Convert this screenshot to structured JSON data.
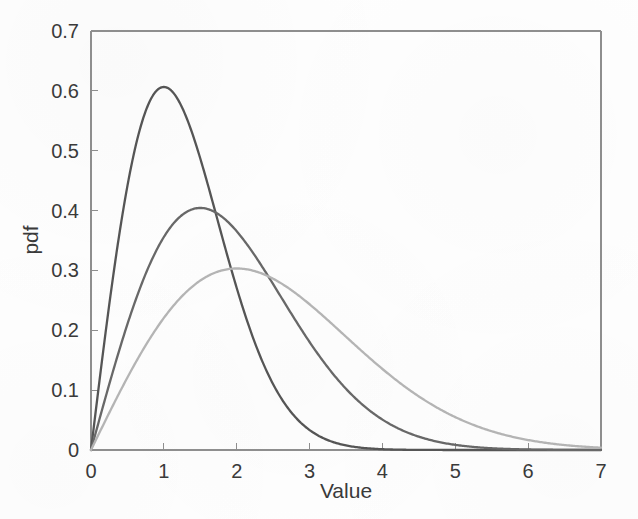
{
  "figure": {
    "background_color": "#fefefe",
    "axis_color": "#8e8e8e",
    "text_color": "#3a3a3a"
  },
  "chart_data": {
    "type": "line",
    "title": "",
    "subtitle": "",
    "xlabel": "Value",
    "ylabel": "pdf",
    "xlim": [
      0,
      7
    ],
    "ylim": [
      0,
      0.7
    ],
    "xticks": [
      0,
      1,
      2,
      3,
      4,
      5,
      6,
      7
    ],
    "xticklabels": [
      "0",
      "1",
      "2",
      "3",
      "4",
      "5",
      "6",
      "7"
    ],
    "yticks": [
      0,
      0.1,
      0.2,
      0.3,
      0.4,
      0.5,
      0.6,
      0.7
    ],
    "yticklabels": [
      "0",
      "0.1",
      "0.2",
      "0.3",
      "0.4",
      "0.5",
      "0.6",
      "0.7"
    ],
    "grid": false,
    "legend": null,
    "legend_position": "none",
    "distribution": "Rayleigh",
    "series": [
      {
        "name": "Rayleigh sigma = 1",
        "color": "#555555",
        "sigma": 1,
        "peak_x": 1,
        "peak_y": 0.6065,
        "x": [
          0,
          0.1,
          0.2,
          0.3,
          0.4,
          0.5,
          0.6,
          0.7,
          0.8,
          0.9,
          1,
          1.1,
          1.2,
          1.3,
          1.4,
          1.5,
          1.6,
          1.7,
          1.8,
          1.9,
          2,
          2.2,
          2.4,
          2.6,
          2.8,
          3,
          3.2,
          3.4,
          3.6,
          3.8,
          4,
          4.5,
          5,
          5.5,
          6,
          6.5,
          7
        ],
        "values": [
          0,
          0.0995,
          0.196,
          0.2869,
          0.3692,
          0.4412,
          0.5011,
          0.5481,
          0.5816,
          0.6019,
          0.6065,
          0.603,
          0.5886,
          0.5656,
          0.5354,
          0.4994,
          0.4593,
          0.4167,
          0.3731,
          0.3298,
          0.2707,
          0.2008,
          0.1413,
          0.0945,
          0.0601,
          0.0333,
          0.0194,
          0.0105,
          0.0054,
          0.0026,
          0.0013,
          0.0002,
          5e-05,
          1e-05,
          0,
          0,
          0
        ]
      },
      {
        "name": "Rayleigh sigma = 1.5",
        "color": "#686868",
        "sigma": 1.5,
        "peak_x": 1.5,
        "peak_y": 0.4043,
        "x": [
          0,
          0.2,
          0.4,
          0.6,
          0.8,
          1,
          1.2,
          1.4,
          1.5,
          1.6,
          1.8,
          2,
          2.2,
          2.4,
          2.6,
          2.8,
          3,
          3.2,
          3.4,
          3.6,
          3.8,
          4,
          4.4,
          4.8,
          5.2,
          5.6,
          6,
          6.5,
          7
        ],
        "values": [
          0,
          0.0881,
          0.1717,
          0.2465,
          0.3091,
          0.357,
          0.3888,
          0.4038,
          0.4043,
          0.4032,
          0.3888,
          0.3638,
          0.3301,
          0.2905,
          0.248,
          0.2053,
          0.1649,
          0.1285,
          0.0972,
          0.0714,
          0.0509,
          0.0353,
          0.0154,
          0.006,
          0.0021,
          0.0007,
          0.0002,
          3e-05,
          1e-05
        ]
      },
      {
        "name": "Rayleigh sigma = 2",
        "color": "#b4b4b4",
        "sigma": 2,
        "peak_x": 2,
        "peak_y": 0.3033,
        "x": [
          0,
          0.25,
          0.5,
          0.75,
          1,
          1.25,
          1.5,
          1.75,
          2,
          2.25,
          2.5,
          2.75,
          3,
          3.25,
          3.5,
          3.75,
          4,
          4.5,
          5,
          5.5,
          6,
          6.5,
          7
        ],
        "values": [
          0,
          0.0615,
          0.1211,
          0.1768,
          0.2265,
          0.2683,
          0.3007,
          0.3226,
          0.3033,
          0.3033,
          0.2907,
          0.2717,
          0.2476,
          0.2197,
          0.1897,
          0.159,
          0.1291,
          0.0784,
          0.0419,
          0.0198,
          0.0082,
          0.003,
          0.001
        ]
      }
    ]
  },
  "axes": {
    "x_title": "Value",
    "y_title": "pdf"
  }
}
